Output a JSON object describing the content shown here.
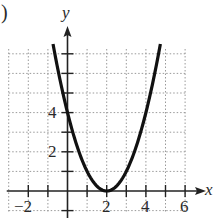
{
  "panel_label": ")",
  "chart_data": {
    "type": "line",
    "title": "",
    "xlabel": "x",
    "ylabel": "y",
    "function": "y = (x - 2)^2",
    "xlim": [
      -3,
      6.5
    ],
    "ylim": [
      -1,
      7.5
    ],
    "grid": true,
    "grid_style": "dotted",
    "x_tick_labels": [
      "-2",
      "2",
      "4",
      "6"
    ],
    "y_tick_labels": [
      "2",
      "4"
    ],
    "series": [
      {
        "name": "parabola",
        "x": [
          -0.74,
          0,
          1,
          2,
          3,
          4,
          4.74
        ],
        "y": [
          7.5,
          4,
          1,
          0,
          1,
          4,
          7.5
        ]
      }
    ],
    "vertex": [
      2,
      0
    ],
    "y_intercept": 4
  },
  "labels": {
    "x_axis": "x",
    "y_axis": "y",
    "xt_m2": "−2",
    "xt_2": "2",
    "xt_4": "4",
    "xt_6": "6",
    "yt_2": "2",
    "yt_4": "4"
  },
  "colors": {
    "curve": "#111111",
    "axis": "#222222",
    "grid": "#9a9a9a"
  }
}
